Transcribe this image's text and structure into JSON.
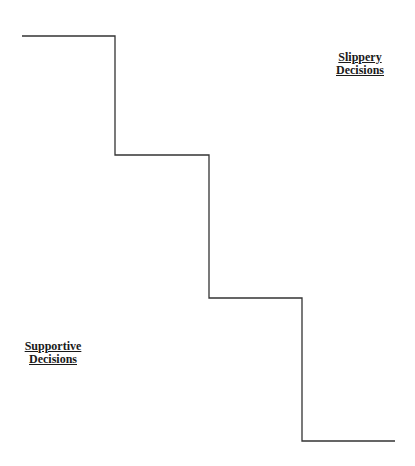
{
  "diagram": {
    "type": "staircase",
    "line_color": "#333333",
    "steps": [
      {
        "x1": 22,
        "x2": 115,
        "y": 36
      },
      {
        "x1": 115,
        "x2": 209,
        "y": 155
      },
      {
        "x1": 209,
        "x2": 302,
        "y": 298
      },
      {
        "x1": 302,
        "x2": 395,
        "y": 441
      }
    ],
    "labels": {
      "top_right": {
        "line1": "Slippery",
        "line2": "Decisions"
      },
      "bottom_left": {
        "line1": "Supportive",
        "line2": "Decisions"
      }
    }
  }
}
